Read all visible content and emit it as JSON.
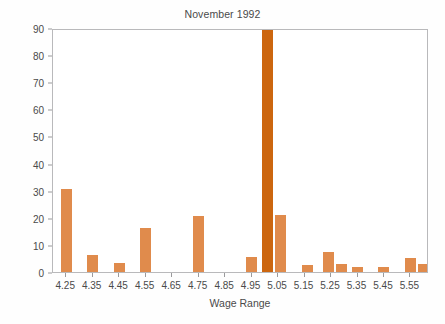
{
  "chart_data": {
    "type": "bar",
    "title": "November 1992",
    "subtitle": "",
    "xlabel": "Wage Range",
    "ylabel": "Percentage of Stores",
    "categories": [
      "4.25",
      "4.35",
      "4.45",
      "4.55",
      "4.65",
      "4.75",
      "4.85",
      "4.95",
      "5.05",
      "5.15",
      "5.25",
      "5.35",
      "5.45",
      "5.55"
    ],
    "values": [
      30.5,
      6.3,
      3.5,
      16.2,
      0,
      20.8,
      0,
      5.5,
      91.0,
      2.6,
      7.2,
      1.9,
      1.9,
      5.0
    ],
    "bars": [
      {
        "label": "4.25",
        "x": 4.25,
        "value": 30.5,
        "color": "#e08b4c",
        "offset": 0
      },
      {
        "label": "4.35",
        "x": 4.35,
        "value": 6.3,
        "color": "#e08b4c",
        "offset": 0
      },
      {
        "label": "4.45",
        "x": 4.45,
        "value": 3.5,
        "color": "#e08b4c",
        "offset": 0
      },
      {
        "label": "4.55",
        "x": 4.55,
        "value": 16.2,
        "color": "#e08b4c",
        "offset": 0
      },
      {
        "label": "4.75",
        "x": 4.75,
        "value": 20.8,
        "color": "#e08b4c",
        "offset": 0
      },
      {
        "label": "4.95",
        "x": 4.95,
        "value": 5.5,
        "color": "#e08b4c",
        "offset": 0
      },
      {
        "label": "5.00",
        "x": 5.01,
        "value": 91.0,
        "color": "#cc660f",
        "offset": 0
      },
      {
        "label": "5.05",
        "x": 5.06,
        "value": 21.0,
        "color": "#e08b4c",
        "offset": 1
      },
      {
        "label": "5.15",
        "x": 5.16,
        "value": 2.6,
        "color": "#e08b4c",
        "offset": 1
      },
      {
        "label": "5.25",
        "x": 5.24,
        "value": 7.2,
        "color": "#e08b4c",
        "offset": 0
      },
      {
        "label": "5.25b",
        "x": 5.29,
        "value": 2.9,
        "color": "#e08b4c",
        "offset": 1
      },
      {
        "label": "5.35",
        "x": 5.35,
        "value": 1.9,
        "color": "#e08b4c",
        "offset": 0
      },
      {
        "label": "5.45",
        "x": 5.45,
        "value": 1.9,
        "color": "#e08b4c",
        "offset": 0
      },
      {
        "label": "5.55",
        "x": 5.55,
        "value": 5.0,
        "color": "#e08b4c",
        "offset": 0
      },
      {
        "label": "5.55b",
        "x": 5.6,
        "value": 3.0,
        "color": "#e08b4c",
        "offset": 1
      }
    ],
    "ylim": [
      0,
      90
    ],
    "yticks": [
      0,
      10,
      20,
      30,
      40,
      50,
      60,
      70,
      80,
      90
    ],
    "xlim": [
      4.2,
      5.62
    ],
    "grid": false,
    "legend": "none",
    "bar_color": "#e08b4c",
    "highlight_bar_color": "#cc660f",
    "axis_color": "#b9b9bb",
    "text_color": "#4a4a4a",
    "note": "Tall bar at $5.05 minimum wage is clipped at the 90% axis maximum"
  }
}
